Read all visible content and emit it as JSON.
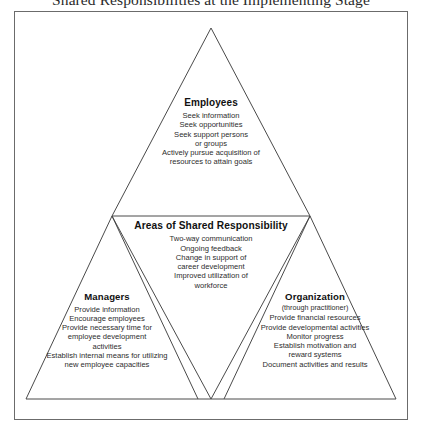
{
  "figure": {
    "title": "Shared Responsibilities at the Implementing Stage",
    "frame_color": "#6b6b6b",
    "line_color": "#4a4a4a",
    "background": "#ffffff",
    "text_color": "#242424"
  },
  "employees": {
    "heading": "Employees",
    "items": [
      "Seek information",
      "Seek opportunities",
      "Seek support persons",
      "or groups",
      "Actively pursue acquisition of",
      "resources to attain goals"
    ]
  },
  "shared": {
    "heading": "Areas of Shared Responsibility",
    "items": [
      "Two-way communication",
      "Ongoing feedback",
      "Change in support of",
      "career development",
      "Improved utilization of",
      "workforce"
    ]
  },
  "managers": {
    "heading": "Managers",
    "items": [
      "Provide information",
      "Encourage employees",
      "Provide necessary time for",
      "employee development",
      "activities",
      "Establish internal means for utilizing",
      "new employee capacities"
    ]
  },
  "organization": {
    "heading": "Organization",
    "subheading": "(through practitioner)",
    "items": [
      "Provide financial resources",
      "Provide developmental activities",
      "Monitor progress",
      "Establish motivation and",
      "reward systems",
      "Document activities and results"
    ]
  }
}
